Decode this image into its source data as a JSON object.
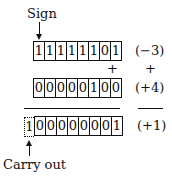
{
  "labels": {
    "sign": "Sign",
    "carry": "Carry out"
  },
  "row1": {
    "bits": [
      "1",
      "1",
      "1",
      "1",
      "1",
      "1",
      "0",
      "1"
    ],
    "value": "(−3)"
  },
  "op": {
    "plus": "+",
    "plus2": "+"
  },
  "row2": {
    "bits": [
      "0",
      "0",
      "0",
      "0",
      "0",
      "1",
      "0",
      "0"
    ],
    "value": "(+4)"
  },
  "result": {
    "carry_bit": "1",
    "bits": [
      "0",
      "0",
      "0",
      "0",
      "0",
      "0",
      "0",
      "1"
    ],
    "value": "(+1)"
  }
}
